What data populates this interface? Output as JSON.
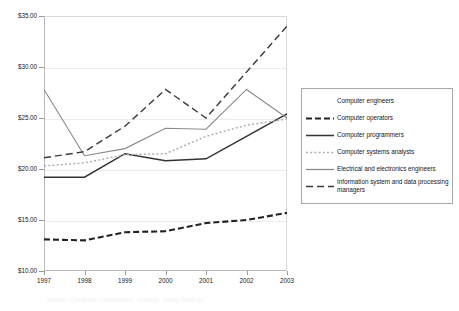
{
  "chart_data": {
    "type": "line",
    "title": "",
    "xlabel": "",
    "ylabel": "",
    "x": [
      1997,
      1998,
      1999,
      2000,
      2001,
      2002,
      2003
    ],
    "xtick_labels": [
      "1997",
      "1998",
      "1999",
      "2000",
      "2001",
      "2002",
      "2003"
    ],
    "ytick_labels": [
      "$10.00",
      "$15.00",
      "$20.00",
      "$25.00",
      "$30.00",
      "$35.00"
    ],
    "ytick_values": [
      10,
      15,
      20,
      25,
      30,
      35
    ],
    "ylim": [
      10,
      35
    ],
    "grid": true,
    "legend_position": "right",
    "series": [
      {
        "name": "Computer engineers",
        "style": "solid",
        "color": "#ffffff",
        "width": 1,
        "visible_in_plot": false,
        "values": [
          null,
          null,
          null,
          null,
          null,
          null,
          null
        ]
      },
      {
        "name": "Computer operators",
        "style": "dashed-bold",
        "color": "#222222",
        "width": 2.1,
        "visible_in_plot": true,
        "values": [
          13.1,
          13.0,
          13.8,
          13.9,
          14.7,
          15.0,
          15.7
        ]
      },
      {
        "name": "Computer programmers",
        "style": "solid",
        "color": "#333333",
        "width": 1.5,
        "visible_in_plot": true,
        "values": [
          19.2,
          19.2,
          21.5,
          20.8,
          21.0,
          23.2,
          25.4
        ]
      },
      {
        "name": "Computer systems analysts",
        "style": "dotted",
        "color": "#b0b0b0",
        "width": 1.5,
        "visible_in_plot": true,
        "values": [
          20.3,
          20.6,
          21.4,
          21.5,
          23.2,
          24.3,
          24.9
        ]
      },
      {
        "name": "Electrical and electronics engineers",
        "style": "solid",
        "color": "#8a8a8a",
        "width": 1.1,
        "visible_in_plot": true,
        "values": [
          27.8,
          21.3,
          22.0,
          24.0,
          23.9,
          27.8,
          25.0
        ]
      },
      {
        "name": "Information system and data processing managers",
        "style": "dashed",
        "color": "#3a3a3a",
        "width": 1.4,
        "visible_in_plot": true,
        "values": [
          21.1,
          21.7,
          24.2,
          27.8,
          25.0,
          29.5,
          34.0
        ]
      }
    ]
  },
  "legend": {
    "entries": [
      "Computer engineers",
      "Computer operators",
      "Computer programmers",
      "Computer systems analysts",
      "Electrical and electronics engineers",
      "Information system and data processing\nmanagers"
    ]
  },
  "caption": {
    "text": "Source: Computer Occupations, average hourly earnings"
  },
  "colors": {
    "plot_border": "#b9b9b9",
    "gridline": "#ececec",
    "axis_text": "#1a1a1a",
    "legend_border": "#a8a8a8",
    "background": "#ffffff"
  }
}
